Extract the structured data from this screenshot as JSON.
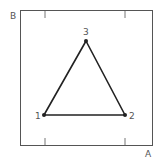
{
  "diagram": {
    "axes": {
      "x_label": "A",
      "y_label": "B",
      "frame": {
        "x": 20,
        "y": 10,
        "width": 133,
        "height": 136
      },
      "ticks_top_x": [
        45,
        125
      ],
      "ticks_bottom_x": [
        45,
        125
      ]
    },
    "vertices": [
      {
        "id": "1",
        "label": "1",
        "x": 44,
        "y": 115
      },
      {
        "id": "2",
        "label": "2",
        "x": 125,
        "y": 115
      },
      {
        "id": "3",
        "label": "3",
        "x": 86,
        "y": 41
      }
    ],
    "edges": [
      [
        "1",
        "2"
      ],
      [
        "2",
        "3"
      ],
      [
        "3",
        "1"
      ]
    ],
    "colors": {
      "frame": "#555555",
      "edge": "#222222",
      "text": "#555555"
    }
  }
}
